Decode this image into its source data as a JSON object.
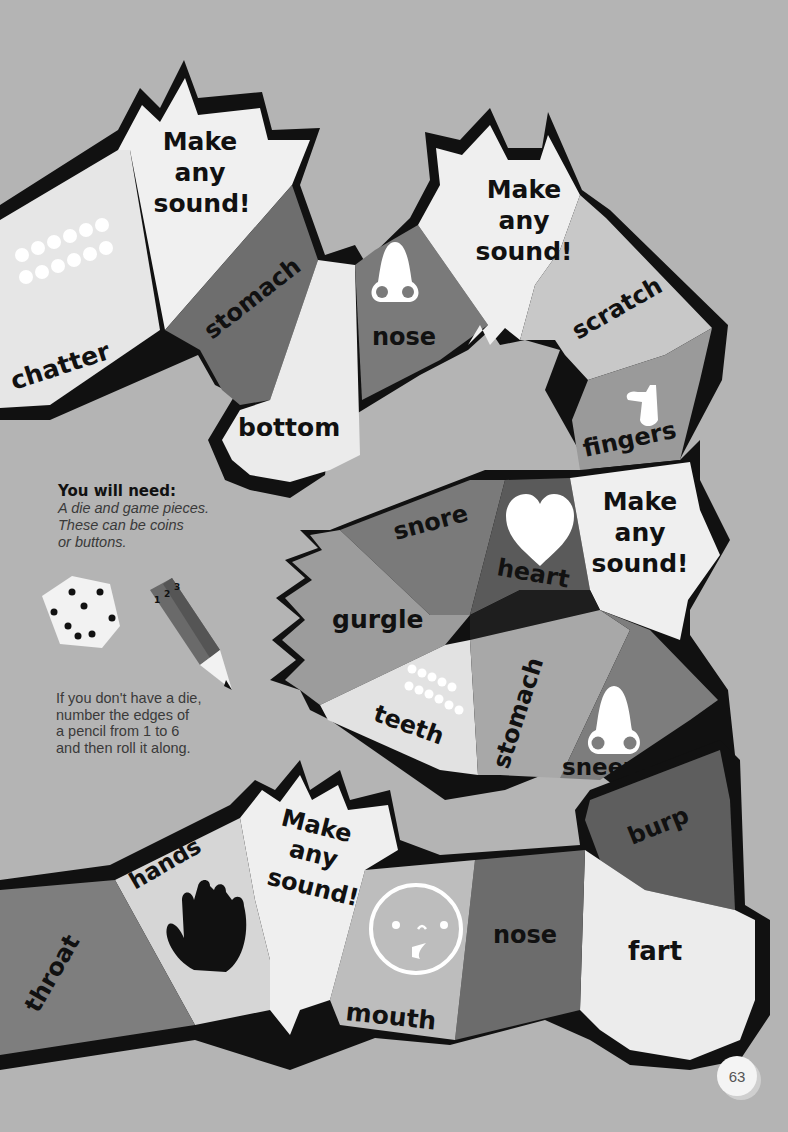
{
  "board": {
    "squares": [
      {
        "id": "chatter",
        "label": "chatter",
        "icon": "teeth-icon",
        "shade": "#e6e6e6"
      },
      {
        "id": "make-any-sound-1",
        "label": "Make any sound!",
        "shade": "#f0f0f0"
      },
      {
        "id": "stomach-1",
        "label": "stomach",
        "shade": "#6e6e6e"
      },
      {
        "id": "bottom",
        "label": "bottom",
        "shade": "#ebebeb"
      },
      {
        "id": "nose-1",
        "label": "nose",
        "icon": "nose-icon",
        "shade": "#7a7a7a"
      },
      {
        "id": "make-any-sound-2",
        "label": "Make any sound!",
        "shade": "#efefef"
      },
      {
        "id": "scratch",
        "label": "scratch",
        "shade": "#c8c8c8"
      },
      {
        "id": "fingers",
        "label": "fingers",
        "icon": "finger-icon",
        "shade": "#9a9a9a"
      },
      {
        "id": "make-any-sound-3",
        "label": "Make any sound!",
        "shade": "#efefef"
      },
      {
        "id": "heart",
        "label": "heart",
        "icon": "heart-icon",
        "shade": "#5a5a5a"
      },
      {
        "id": "snore",
        "label": "snore",
        "shade": "#7a7a7a"
      },
      {
        "id": "gurgle",
        "label": "gurgle",
        "shade": "#9c9c9c"
      },
      {
        "id": "teeth",
        "label": "teeth",
        "icon": "teeth-icon",
        "shade": "#e2e2e2"
      },
      {
        "id": "stomach-2",
        "label": "stomach",
        "shade": "#a8a8a8"
      },
      {
        "id": "sneeze",
        "label": "sneeze",
        "icon": "nose-icon",
        "shade": "#7d7d7d"
      },
      {
        "id": "burp",
        "label": "burp",
        "shade": "#5e5e5e"
      },
      {
        "id": "fart",
        "label": "fart",
        "shade": "#ececec"
      },
      {
        "id": "nose-2",
        "label": "nose",
        "shade": "#6c6c6c"
      },
      {
        "id": "mouth",
        "label": "mouth",
        "icon": "face-icon",
        "shade": "#bdbdbd"
      },
      {
        "id": "make-any-sound-4",
        "label": "Make any sound!",
        "shade": "#efefef"
      },
      {
        "id": "hands",
        "label": "hands",
        "icon": "hand-icon",
        "shade": "#d6d6d6"
      },
      {
        "id": "throat",
        "label": "throat",
        "shade": "#7e7e7e"
      }
    ],
    "make_any_sound_lines": [
      "Make",
      "any",
      "sound!"
    ]
  },
  "info": {
    "heading": "You will need:",
    "lines": [
      "A die and game pieces.",
      "These can be coins",
      "or buttons."
    ]
  },
  "tip": {
    "lines": [
      "If you don't have a die,",
      "number the edges of",
      "a pencil from 1 to 6",
      "and then roll it along."
    ]
  },
  "pencil_numbers": [
    "1",
    "2",
    "3"
  ],
  "page_number": "63",
  "colors": {
    "background": "#b4b4b4",
    "outline": "#111111"
  }
}
